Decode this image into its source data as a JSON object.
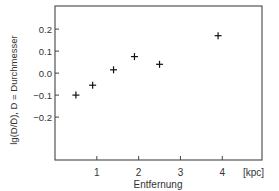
{
  "chart_data": {
    "type": "scatter",
    "title": "",
    "xlabel": "Entfernung",
    "x_unit": "[kpc]",
    "ylabel": "lg(D/D̄), D = Durchmesser",
    "xlim": [
      0,
      4.95
    ],
    "ylim": [
      -0.395,
      0.305
    ],
    "x_ticks": [
      1,
      2,
      3,
      4
    ],
    "x_tick_labels": [
      "1",
      "2",
      "3",
      "4"
    ],
    "y_ticks": [
      0.2,
      0.1,
      0.0,
      -0.1,
      -0.2
    ],
    "y_tick_labels": [
      "0.2",
      "0.1",
      "0.0",
      "−0.1",
      "−0.2"
    ],
    "grid": false,
    "legend": null,
    "marker": "+",
    "series": [
      {
        "name": "lg(D/D̄)",
        "x": [
          0.5,
          0.9,
          1.4,
          1.9,
          2.5,
          3.9
        ],
        "y": [
          -0.1,
          -0.055,
          0.015,
          0.075,
          0.04,
          0.17
        ]
      }
    ]
  }
}
